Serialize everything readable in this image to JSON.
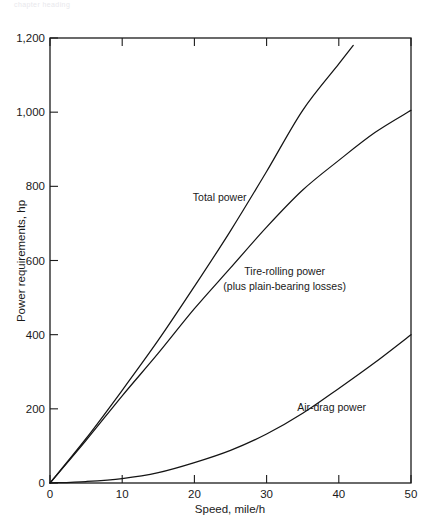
{
  "figure": {
    "faint_header": "chapter heading",
    "background": "#ffffff",
    "ink_color": "#141414"
  },
  "chart_data": {
    "type": "line",
    "title": "",
    "xlabel": "Speed, mile/h",
    "ylabel": "Power requirements, hp",
    "xlim": [
      0,
      50
    ],
    "ylim": [
      0,
      1200
    ],
    "xticks": [
      0,
      10,
      20,
      30,
      40,
      50
    ],
    "xtick_labels": [
      "0",
      "10",
      "20",
      "30",
      "40",
      "50"
    ],
    "yticks": [
      0,
      200,
      400,
      600,
      800,
      1000,
      1200
    ],
    "ytick_labels": [
      "0",
      "200",
      "400",
      "600",
      "800",
      "1,000",
      "1,200"
    ],
    "grid": false,
    "legend": "inline-annotations",
    "series": [
      {
        "name": "Total power",
        "label": "Total power",
        "x": [
          0,
          5,
          10,
          15,
          20,
          25,
          30,
          35,
          40,
          42
        ],
        "values": [
          0,
          120,
          250,
          385,
          530,
          680,
          840,
          1005,
          1130,
          1180
        ]
      },
      {
        "name": "Tire-rolling power (plus plain-bearing losses)",
        "label": "Tire-rolling power",
        "label_line2": "(plus plain-bearing losses)",
        "x": [
          0,
          5,
          10,
          15,
          20,
          25,
          30,
          35,
          40,
          45,
          50
        ],
        "values": [
          0,
          115,
          235,
          350,
          470,
          580,
          690,
          790,
          870,
          945,
          1005
        ]
      },
      {
        "name": "Air-drag power",
        "label": "Air-drag power",
        "x": [
          0,
          5,
          10,
          15,
          20,
          25,
          30,
          35,
          40,
          45,
          50
        ],
        "values": [
          0,
          4,
          12,
          28,
          55,
          88,
          132,
          188,
          255,
          325,
          400
        ]
      }
    ],
    "annotations": [
      {
        "text": "Total power",
        "x_data": 23.5,
        "y_data": 760
      },
      {
        "text": "Tire-rolling power",
        "x_data": 32.5,
        "y_data": 560
      },
      {
        "text": "(plus plain-bearing losses)",
        "x_data": 32.5,
        "y_data": 520
      },
      {
        "text": "Air-drag power",
        "x_data": 39.0,
        "y_data": 195
      }
    ]
  }
}
